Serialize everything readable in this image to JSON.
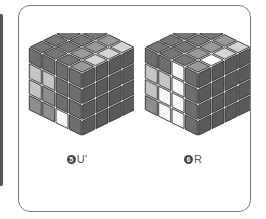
{
  "figure": {
    "colors": {
      "dark": "#6e6e6e",
      "mid": "#8e8e8e",
      "light": "#c4c4c4",
      "white": "#f7f7f7",
      "outline": "#2e2e2e",
      "ghost_outline": "#555555"
    },
    "steps": [
      {
        "number": "5",
        "move": "U'",
        "top": [
          [
            "dark",
            "dark",
            "mid",
            "light"
          ],
          [
            "dark",
            "dark",
            "mid",
            "light"
          ],
          [
            "dark",
            "dark",
            "mid",
            "light"
          ],
          [
            "dark",
            "dark",
            "dark",
            "mid"
          ]
        ],
        "left": [
          [
            "dark",
            "dark",
            "dark",
            "dark"
          ],
          [
            "light",
            "light",
            "dark",
            "dark"
          ],
          [
            "light",
            "mid",
            "dark",
            "dark"
          ],
          [
            "mid",
            "mid",
            "white",
            "dark"
          ]
        ],
        "right": [
          [
            "dark",
            "dark",
            "dark",
            "dark"
          ],
          [
            "dark",
            "dark",
            "dark",
            "dark"
          ],
          [
            "dark",
            "dark",
            "dark",
            "dark"
          ],
          [
            "dark",
            "dark",
            "dark",
            "dark"
          ]
        ]
      },
      {
        "number": "6",
        "move": "R",
        "top": [
          [
            "dark",
            "dark",
            "mid",
            "light"
          ],
          [
            "dark",
            "dark",
            "mid",
            "light"
          ],
          [
            "dark",
            "dark",
            "mid",
            "white"
          ],
          [
            "dark",
            "dark",
            "dark",
            "mid"
          ]
        ],
        "left": [
          [
            "dark",
            "dark",
            "white",
            "dark"
          ],
          [
            "light",
            "light",
            "white",
            "dark"
          ],
          [
            "light",
            "white",
            "white",
            "dark"
          ],
          [
            "mid",
            "white",
            "white",
            "dark"
          ]
        ],
        "right": [
          [
            "dark",
            "dark",
            "dark",
            "dark"
          ],
          [
            "dark",
            "dark",
            "dark",
            "dark"
          ],
          [
            "dark",
            "dark",
            "dark",
            "dark"
          ],
          [
            "dark",
            "dark",
            "dark",
            "dark"
          ]
        ]
      }
    ]
  }
}
